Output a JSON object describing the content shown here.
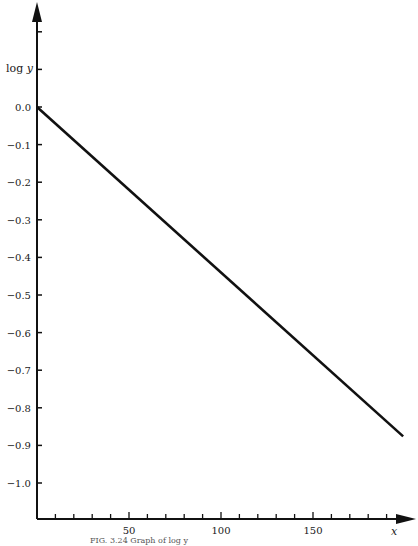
{
  "chart_data": {
    "type": "line",
    "title": "",
    "xlabel": "x",
    "ylabel": "log y",
    "xlim": [
      0,
      205
    ],
    "ylim": [
      -1.1,
      0.25
    ],
    "grid": false,
    "legend": null,
    "x_tick_labels": [
      "50",
      "100",
      "150"
    ],
    "x_tick_values": [
      50,
      100,
      150
    ],
    "x_minor_tick_step": 10,
    "y_tick_labels": [
      "0.0",
      "−0.1",
      "−0.2",
      "−0.3",
      "−0.4",
      "−0.5",
      "−0.6",
      "−0.7",
      "−0.8",
      "−0.9",
      "−1.0"
    ],
    "y_tick_values": [
      0.0,
      -0.1,
      -0.2,
      -0.3,
      -0.4,
      -0.5,
      -0.6,
      -0.7,
      -0.8,
      -0.9,
      -1.0
    ],
    "y_unlabeled_ticks": [
      0.1,
      0.2
    ],
    "series": [
      {
        "name": "log y",
        "x": [
          0,
          199
        ],
        "y": [
          0.0,
          -0.876
        ]
      }
    ],
    "caption": "FIG. 3.24  Graph of log y"
  }
}
